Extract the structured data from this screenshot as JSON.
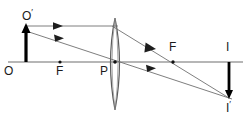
{
  "figure": {
    "type": "ray-diagram",
    "canvas": {
      "width": 249,
      "height": 120,
      "background": "#ffffff"
    },
    "stroke_colors": {
      "axis": "#6f6f6f",
      "ray": "#6f6f6f",
      "lens": "#5a5a5a",
      "object": "#000000",
      "image": "#000000",
      "label": "#1a1a1a"
    }
  },
  "labels": [
    {
      "id": "object-top",
      "text": "O",
      "prime": true,
      "x": 24,
      "y": 10,
      "anchor": "below-right-of-arrow-tip"
    },
    {
      "id": "object-base",
      "text": "O",
      "prime": false,
      "x": 6,
      "y": 66,
      "anchor": "below-axis"
    },
    {
      "id": "focal-left",
      "text": "F",
      "prime": false,
      "x": 57,
      "y": 66,
      "anchor": "below-axis"
    },
    {
      "id": "lens-center",
      "text": "P",
      "prime": false,
      "x": 101,
      "y": 66,
      "anchor": "below-axis"
    },
    {
      "id": "focal-right",
      "text": "F",
      "prime": false,
      "x": 169,
      "y": 42,
      "anchor": "above-axis"
    },
    {
      "id": "image-top",
      "text": "I",
      "prime": false,
      "x": 226,
      "y": 42,
      "anchor": "above-axis"
    },
    {
      "id": "image-bottom",
      "text": "I",
      "prime": true,
      "x": 226,
      "y": 101,
      "anchor": "below-image-tip"
    }
  ],
  "points": {
    "O": {
      "x": 8,
      "y": 62,
      "label": "O",
      "marked": false
    },
    "F_left": {
      "x": 60,
      "y": 62,
      "label": "F",
      "marked": true
    },
    "P": {
      "x": 115,
      "y": 62,
      "label": "P",
      "marked": true
    },
    "F_right": {
      "x": 173,
      "y": 62,
      "label": "F",
      "marked": true
    },
    "I": {
      "x": 229,
      "y": 62,
      "label": "I",
      "marked": false
    },
    "O_prime": {
      "x": 26,
      "y": 26,
      "label": "O'"
    },
    "I_prime": {
      "x": 229,
      "y": 98,
      "label": "I'"
    }
  },
  "axis": {
    "x1": 8,
    "y1": 62,
    "x2": 243,
    "y2": 62
  },
  "lens": {
    "center_x": 115,
    "center_y": 62,
    "top_y": 18,
    "bottom_y": 110,
    "half_width": 9,
    "shape": "biconvex"
  },
  "object_arrow": {
    "x": 26,
    "base_y": 62,
    "tip_y": 26,
    "direction": "up",
    "description": "upright object arrow O to O-prime"
  },
  "image_arrow": {
    "x": 229,
    "base_y": 62,
    "tip_y": 98,
    "direction": "down",
    "description": "inverted real image arrow I to I-prime"
  },
  "rays": [
    {
      "id": "ray-parallel",
      "description": "parallel ray from O' to lens, refracted through right focal point F and on to I'",
      "segments": [
        {
          "x1": 26,
          "y1": 26,
          "x2": 115,
          "y2": 26
        },
        {
          "x1": 115,
          "y1": 26,
          "x2": 229,
          "y2": 98
        }
      ],
      "arrowheads": [
        {
          "x": 58,
          "y": 26,
          "angle_deg": 0
        },
        {
          "x": 152,
          "y": 49,
          "angle_deg": 32
        }
      ]
    },
    {
      "id": "ray-center",
      "description": "ray from O' straight through lens centre P, undeviated, to I'",
      "segments": [
        {
          "x1": 26,
          "y1": 31,
          "x2": 229,
          "y2": 98
        }
      ],
      "arrowheads": [
        {
          "x": 60,
          "y": 42,
          "angle_deg": 18
        },
        {
          "x": 152,
          "y": 73,
          "angle_deg": 18
        }
      ]
    }
  ],
  "notes": {
    "object_position": "beyond 2F on the left of a converging lens",
    "image_position": "real, inverted, formed beyond F on the right"
  }
}
